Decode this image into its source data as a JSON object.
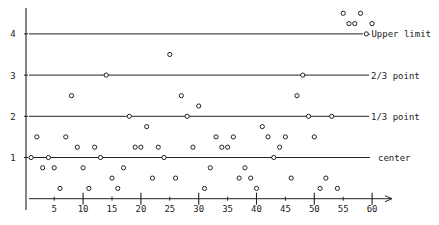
{
  "chart_data": {
    "type": "scatter",
    "title": "",
    "xlabel": "",
    "ylabel": "",
    "xlim": [
      0,
      63
    ],
    "ylim": [
      0,
      4.6
    ],
    "grid": false,
    "x_ticks": [
      5,
      10,
      15,
      20,
      25,
      30,
      35,
      40,
      45,
      50,
      55,
      60
    ],
    "x_major_ticks": [
      10,
      20,
      30,
      40,
      50,
      60
    ],
    "y_ticks": [
      1,
      2,
      3,
      4
    ],
    "reference_lines": [
      {
        "name": "center",
        "label": "center",
        "y": 1
      },
      {
        "name": "one-third-point",
        "label": "1/3 point",
        "y": 2
      },
      {
        "name": "two-thirds-point",
        "label": "2/3 point",
        "y": 3
      },
      {
        "name": "upper-limit",
        "label": "-Upper limit",
        "y": 4
      }
    ],
    "series": [
      {
        "name": "observations",
        "marker": "open-circle",
        "x": [
          1,
          2,
          3,
          4,
          5,
          6,
          7,
          8,
          9,
          10,
          11,
          12,
          13,
          14,
          15,
          16,
          17,
          18,
          19,
          20,
          21,
          22,
          23,
          24,
          25,
          26,
          27,
          28,
          29,
          30,
          31,
          32,
          33,
          34,
          35,
          36,
          37,
          38,
          39,
          40,
          41,
          42,
          43,
          44,
          45,
          46,
          47,
          48,
          49,
          50,
          51,
          52,
          53,
          54,
          55,
          56,
          57,
          58,
          59,
          60
        ],
        "values": [
          1,
          1.5,
          0.75,
          1,
          0.75,
          0.25,
          1.5,
          2.5,
          1.25,
          0.75,
          0.25,
          1.25,
          1,
          3,
          0.5,
          0.25,
          0.75,
          2,
          1.25,
          1.25,
          1.75,
          0.5,
          1.25,
          1,
          3.5,
          0.5,
          2.5,
          2,
          1.25,
          2.25,
          0.25,
          0.75,
          1.5,
          1.25,
          1.25,
          1.5,
          0.5,
          0.75,
          0.5,
          0.25,
          1.75,
          1.5,
          1,
          1.25,
          1.5,
          0.5,
          2.5,
          3,
          2,
          1.5,
          0.25,
          0.5,
          2,
          0.25,
          4.5,
          4.25,
          4.25,
          4.5,
          4,
          4.25
        ]
      }
    ]
  },
  "colors": {
    "ink": "#222222",
    "background": "#ffffff"
  }
}
